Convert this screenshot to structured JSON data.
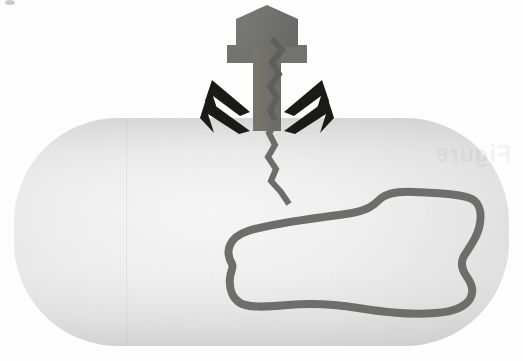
{
  "figure": {
    "caption": "A T-even bacteriophage attached to the surface of a bacterium injects its zigzag DNA strand through the cell wall; the bacterium's own circular chromosome lies within the cytoplasm.",
    "canvas": {
      "width": 523,
      "height": 361
    },
    "background_color": "#ffffff"
  },
  "colors": {
    "phage_body": "#73736f",
    "phage_body_shade": "#6a6a66",
    "phage_leg": "#1a1a18",
    "injected_dna": "#6d6d69",
    "cell_fill_light": "#f4f4f4",
    "cell_fill_mid": "#e9e9e9",
    "cell_fill_dark": "#d9d9d9",
    "chromosome_stroke": "#6e6e6c",
    "background": "#ffffff"
  },
  "bacterium": {
    "label": "bacterial cell",
    "shape": "rounded-rectangle",
    "x": 14,
    "y": 118,
    "width": 495,
    "height": 228,
    "corner_radius": 104,
    "fill_description": "pale gray radial gradient, lightest near the center-left, darker toward the rim"
  },
  "chromosome": {
    "label": "bacterial chromosome",
    "shape": "closed irregular loop",
    "stroke_width": 8,
    "fill": "none",
    "path": "M 232 264 C 224 250 230 237 248 231 C 275 222 320 218 352 213 C 368 210 374 205 379 200 C 386 193 397 191 414 192 C 438 193 462 194 472 199 C 481 204 482 216 479 228 C 476 240 468 249 464 256 C 460 263 462 270 467 277 C 472 284 474 292 470 299 C 465 307 452 312 436 313 C 412 315 382 312 358 308 C 334 304 310 303 288 305 C 266 307 248 308 240 303 C 232 298 229 288 230 278 C 230 272 234 268 232 264 Z"
  },
  "phage": {
    "label": "bacteriophage",
    "head": {
      "label": "phage head (capsid)",
      "shape": "pentagon",
      "points": "236,47 236,19 267,5 298,19 298,47"
    },
    "collar": {
      "label": "phage collar / baseplate shoulder",
      "points": "227,47 307,47 307,63 227,63"
    },
    "tail": {
      "label": "phage tail sheath",
      "points": "253,47 281,47 281,131 253,131"
    },
    "legs": [
      {
        "label": "phage tail fiber upper-left",
        "points": "212,81 248,113 239,116 212,97 218,114 207,103"
      },
      {
        "label": "phage tail fiber lower-left",
        "points": "206,99 248,130 238,132 209,114 215,130 202,119"
      },
      {
        "label": "phage tail fiber upper-right",
        "points": "322,81 286,113 295,116 322,97 316,114 327,103"
      },
      {
        "label": "phage tail fiber lower-right",
        "points": "328,99 286,130 296,132 325,114 319,130 332,119"
      }
    ],
    "dna_strand": {
      "label": "injected phage DNA",
      "stroke_width": 6,
      "path": "M 273 60 L 281 71 L 273 84 L 278 95 L 270 106 L 276 118 L 269 130 L 276 142 L 268 154 L 275 166 L 270 178 L 281 190 L 288 203"
    }
  },
  "artifacts": {
    "ghost_text": "Figure",
    "page_fold_label": "page-fold-line",
    "speck_label": "scan-speck"
  }
}
